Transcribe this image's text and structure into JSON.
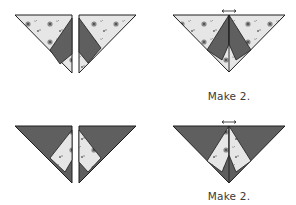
{
  "diagram": {
    "colors": {
      "print_fabric": "#e6e6e6",
      "dark_fabric": "#5f5f5f",
      "outline": "#1e1e1e",
      "motif": "#8a8a8a",
      "motif_dark": "#3a3a3a"
    },
    "steps": [
      {
        "row": 1,
        "pieces": "Two half-square triangle units, print with dark center strip",
        "result": "Joined triangle unit, print outer, dark inner bands",
        "caption": "Make 2."
      },
      {
        "row": 2,
        "pieces": "Two half-square triangle units, dark with print center strip",
        "result": "Joined triangle unit, dark outer, print inner bands",
        "caption": "Make 2."
      }
    ],
    "press_arrow": "pressing direction arrows at top seam"
  }
}
